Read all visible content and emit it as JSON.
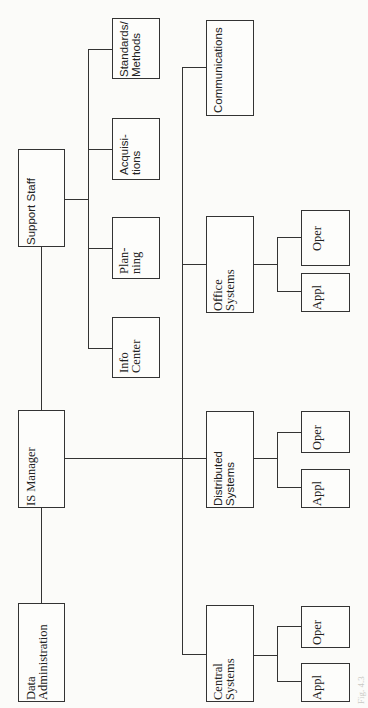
{
  "diagram": {
    "type": "organization-chart",
    "orientation": "rotated-90-ccw",
    "top_level": [
      {
        "id": "data-admin",
        "label": "Data\nAdministration"
      },
      {
        "id": "is-manager",
        "label": "IS Manager"
      },
      {
        "id": "support-staff",
        "label": "Support Staff"
      }
    ],
    "support_staff_units": [
      {
        "id": "info-center",
        "label": "Info\nCenter"
      },
      {
        "id": "planning",
        "label": "Plan-\nning"
      },
      {
        "id": "acquisitions",
        "label": "Acquisi-\ntions"
      },
      {
        "id": "standards",
        "label": "Standards/\nMethods"
      }
    ],
    "systems_units": [
      {
        "id": "central",
        "label": "Central\nSystems",
        "children": [
          "Appl",
          "Oper"
        ]
      },
      {
        "id": "distributed",
        "label": "Distributed\nSystems",
        "children": [
          "Appl",
          "Oper"
        ]
      },
      {
        "id": "office",
        "label": "Office\nSystems",
        "children": [
          "Appl",
          "Oper"
        ]
      },
      {
        "id": "communications",
        "label": "Communications",
        "children": []
      }
    ],
    "sub_labels": {
      "appl": "Appl",
      "oper": "Oper"
    },
    "caption_partial": "Fig. 4.3"
  }
}
